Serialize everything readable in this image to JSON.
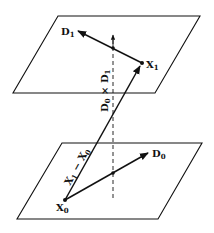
{
  "diagram": {
    "type": "geometry",
    "colors": {
      "line": "#111111",
      "background": "#ffffff"
    },
    "top_plane": {
      "points": "58,16 200,16 155,93 13,93",
      "point_label": {
        "main": "X",
        "sub": "1"
      },
      "direction_label": {
        "main": "D",
        "sub": "1"
      }
    },
    "bottom_plane": {
      "points": "62,143 202,143 158,219 17,219",
      "point_label": {
        "main": "X",
        "sub": "0"
      },
      "direction_label": {
        "main": "D",
        "sub": "0"
      }
    },
    "labels": {
      "cross_product": {
        "a_main": "D",
        "a_sub": "0",
        "op": " × ",
        "b_main": "D",
        "b_sub": "1"
      },
      "difference": {
        "a_main": "X",
        "a_sub": "1",
        "op": " − ",
        "b_main": "X",
        "b_sub": "0"
      }
    }
  }
}
